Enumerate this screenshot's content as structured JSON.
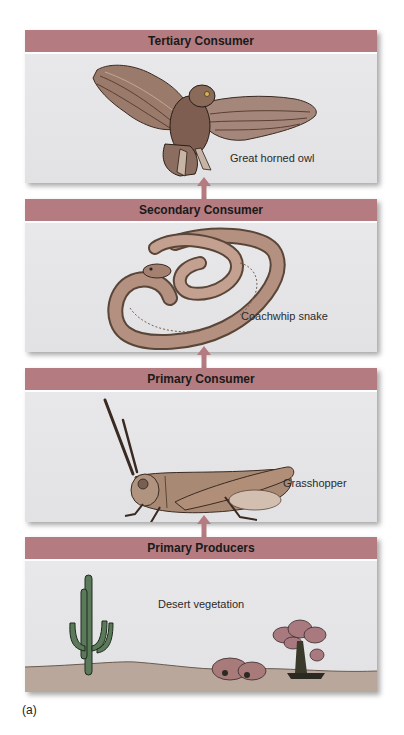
{
  "figure": {
    "label": "(a)",
    "colors": {
      "header_bar": "#b47c80",
      "panel_bg": "#e4e4e6",
      "arrow": "#b47c80",
      "ground": "#b9a79c"
    }
  },
  "levels": [
    {
      "title": "Tertiary Consumer",
      "organism": "Great horned owl",
      "icon": "owl-illustration"
    },
    {
      "title": "Secondary Consumer",
      "organism": "Coachwhip snake",
      "icon": "snake-illustration"
    },
    {
      "title": "Primary Consumer",
      "organism": "Grasshopper",
      "icon": "grasshopper-illustration"
    },
    {
      "title": "Primary Producers",
      "organism": "Desert vegetation",
      "icon": "desert-plants-illustration"
    }
  ],
  "arrows": [
    {
      "from": "Primary Producers",
      "to": "Primary Consumer",
      "icon": "arrow-up-icon"
    },
    {
      "from": "Primary Consumer",
      "to": "Secondary Consumer",
      "icon": "arrow-up-icon"
    },
    {
      "from": "Secondary Consumer",
      "to": "Tertiary Consumer",
      "icon": "arrow-up-icon"
    }
  ]
}
